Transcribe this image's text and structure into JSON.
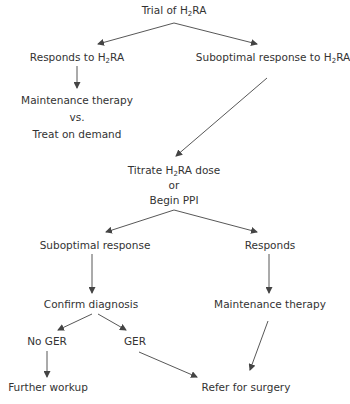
{
  "diagram": {
    "type": "flowchart",
    "nodes": {
      "trial": {
        "pre": "Trial of H",
        "sub": "2",
        "post": "RA"
      },
      "responds_h2ra": {
        "pre": "Responds to H",
        "sub": "2",
        "post": "RA"
      },
      "suboptimal_h2ra": {
        "pre": "Suboptimal response to H",
        "sub": "2",
        "post": "RA"
      },
      "maintenance_vs_treat": {
        "line1": "Maintenance therapy",
        "line2": "vs.",
        "line3": "Treat on demand"
      },
      "titrate": {
        "line1_pre": "Titrate H",
        "line1_sub": "2",
        "line1_post": "RA dose",
        "line2": "or",
        "line3": "Begin PPI"
      },
      "suboptimal_response": "Suboptimal response",
      "responds": "Responds",
      "confirm_diagnosis": "Confirm diagnosis",
      "maintenance_therapy": "Maintenance therapy",
      "no_ger": "No GER",
      "ger": "GER",
      "further_workup": "Further workup",
      "refer_surgery": "Refer for surgery"
    },
    "edges": [
      {
        "from": "trial",
        "to": "responds_h2ra"
      },
      {
        "from": "trial",
        "to": "suboptimal_h2ra"
      },
      {
        "from": "responds_h2ra",
        "to": "maintenance_vs_treat"
      },
      {
        "from": "suboptimal_h2ra",
        "to": "titrate"
      },
      {
        "from": "titrate",
        "to": "suboptimal_response"
      },
      {
        "from": "titrate",
        "to": "responds"
      },
      {
        "from": "suboptimal_response",
        "to": "confirm_diagnosis"
      },
      {
        "from": "responds",
        "to": "maintenance_therapy"
      },
      {
        "from": "confirm_diagnosis",
        "to": "no_ger"
      },
      {
        "from": "confirm_diagnosis",
        "to": "ger"
      },
      {
        "from": "no_ger",
        "to": "further_workup"
      },
      {
        "from": "ger",
        "to": "refer_surgery"
      },
      {
        "from": "maintenance_therapy",
        "to": "refer_surgery"
      }
    ],
    "colors": {
      "text": "#333333",
      "line": "#444444"
    }
  }
}
